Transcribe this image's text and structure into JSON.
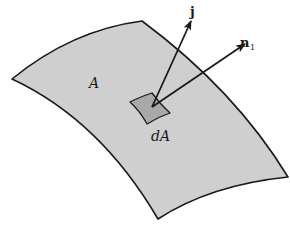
{
  "figure": {
    "surface_label": "A",
    "element_label": "dA",
    "vector_j_label": "j",
    "vector_n_label": "n",
    "vector_n_subscript": "1"
  },
  "colors": {
    "background": "#ffffff",
    "surface_fill": "#cfcfcf",
    "element_fill": "#a8a8a8",
    "stroke": "#1a1a1a"
  }
}
